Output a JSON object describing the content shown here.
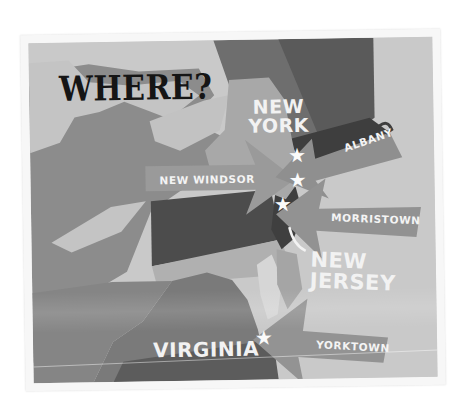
{
  "title": "WHERE?",
  "states": {
    "new_york": [
      "NEW",
      "YORK"
    ],
    "new_jersey": "NEW JERSEY",
    "virginia": "VIRGINIA"
  },
  "locations": [
    {
      "name": "NEW WINDSOR",
      "state": "New York",
      "marker": "star-icon"
    },
    {
      "name": "ALBANY",
      "state": "New York",
      "marker": "star-icon"
    },
    {
      "name": "MORRISTOWN",
      "state": "New Jersey",
      "marker": "star-icon"
    },
    {
      "name": "YORKTOWN",
      "state": "Virginia",
      "marker": "star-icon"
    }
  ],
  "markers": {
    "star": "★"
  },
  "colors": {
    "background_light": "#c9c9c9",
    "land_mid": "#8a8a8a",
    "land_dark": "#5e5e5e",
    "land_darker": "#4a4a4a",
    "arrow": "#9a9a9a",
    "text_light": "#f2f2f2",
    "title": "#151515"
  }
}
